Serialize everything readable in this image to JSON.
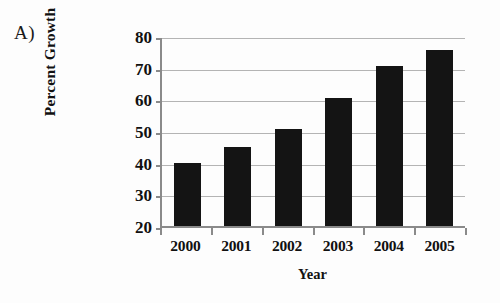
{
  "figure": {
    "panel_label": "A)"
  },
  "chart_data": {
    "type": "bar",
    "title": "",
    "categories": [
      "2000",
      "2001",
      "2002",
      "2003",
      "2004",
      "2005"
    ],
    "values": [
      40,
      45,
      50.5,
      60.5,
      70.5,
      75.5
    ],
    "xlabel": "Year",
    "ylabel": "Percent Growth",
    "ylim": [
      20,
      80
    ],
    "ytick_labels": [
      "80",
      "70",
      "60",
      "50",
      "40",
      "30",
      "20"
    ],
    "ytick_values": [
      80,
      70,
      60,
      50,
      40,
      30,
      20
    ],
    "grid": "horizontal",
    "legend": "none",
    "bar_color": "#141414",
    "grid_color": "#b4b4b4",
    "axis_color": "#8a8a8a",
    "background_color": "#fdfdfd"
  }
}
